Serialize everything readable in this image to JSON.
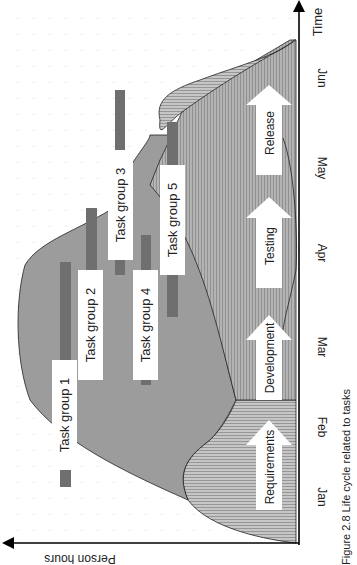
{
  "figure": {
    "caption": "Figure 2.8 Life cycle related to tasks",
    "orientation": "rotated-90",
    "axes": {
      "x_label": "Person hours",
      "y_label": "Time",
      "months": [
        "Jan",
        "Feb",
        "Mar",
        "Apr",
        "May",
        "Jun"
      ]
    },
    "phases": [
      {
        "label": "Requirements",
        "pattern": "horizontal-hatch"
      },
      {
        "label": "Development",
        "pattern": "solid-grey"
      },
      {
        "label": "Testing",
        "pattern": "vertical-hatch"
      },
      {
        "label": "Release",
        "pattern": "horizontal-hatch"
      }
    ],
    "task_groups": [
      {
        "label": "Task group 1"
      },
      {
        "label": "Task group 2"
      },
      {
        "label": "Task group 3"
      },
      {
        "label": "Task group 4"
      },
      {
        "label": "Task group 5"
      }
    ],
    "colors": {
      "background": "#ffffff",
      "development_fill": "#9a9a9a",
      "hatch_fill": "#bdbdbd",
      "task_bar": "#6e6e6e",
      "axis": "#000000"
    }
  }
}
